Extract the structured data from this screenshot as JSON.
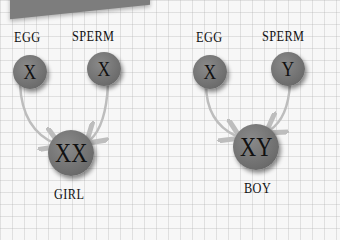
{
  "left_group": {
    "egg_label": "EGG",
    "sperm_label": "SPERM",
    "egg_chromosome": "X",
    "sperm_chromosome": "X",
    "result_chromosomes": "XX",
    "result_label": "GIRL"
  },
  "right_group": {
    "egg_label": "EGG",
    "sperm_label": "SPERM",
    "egg_chromosome": "X",
    "sperm_chromosome": "Y",
    "result_chromosomes": "XY",
    "result_label": "BOY"
  },
  "colors": {
    "circle": "#777777",
    "arrow": "#bdbdbd",
    "banner": "#7d7d7d",
    "background": "#f7f7f7"
  }
}
